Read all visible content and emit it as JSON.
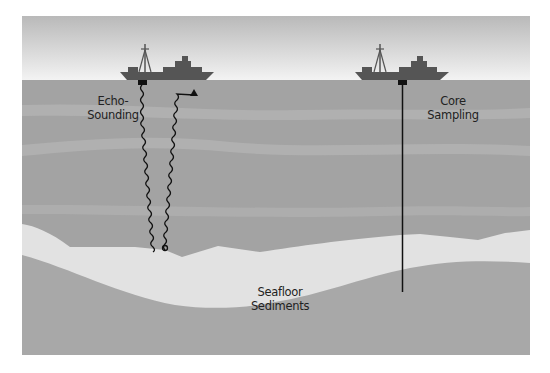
{
  "diagram": {
    "colors": {
      "sky_top": "#b8b8b8",
      "sky_bottom": "#f2f2f2",
      "water": "#a3a3a3",
      "water_band": "#b2b2b2",
      "sediment": "#e2e2e2",
      "bedrock": "#a8a8a8",
      "ship": "#555555",
      "line": "#111111"
    },
    "labels": {
      "echo_line1": "Echo-",
      "echo_line2": "Sounding",
      "core_line1": "Core",
      "core_line2": "Sampling",
      "sed_line1": "Seafloor",
      "sed_line2": "Sediments"
    },
    "elements": [
      {
        "name": "ship-left",
        "method": "Echo-Sounding"
      },
      {
        "name": "ship-right",
        "method": "Core Sampling"
      }
    ]
  }
}
